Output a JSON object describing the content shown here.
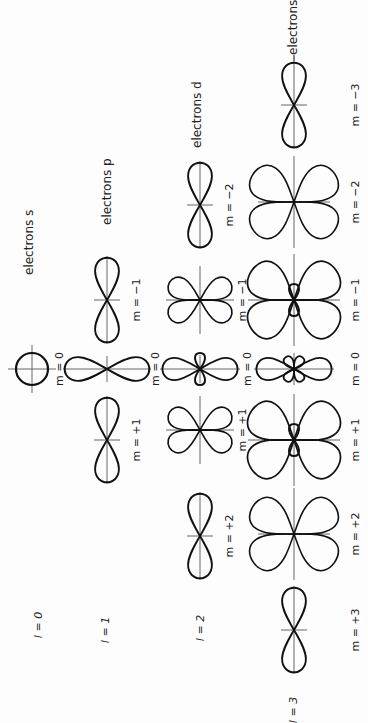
{
  "figure": {
    "rows": [
      {
        "l_label": "l = 0",
        "series_label": "electrons s",
        "orbitals": [
          {
            "m": "m = 0",
            "shape": "circle"
          }
        ]
      },
      {
        "l_label": "l = 1",
        "series_label": "electrons p",
        "orbitals": [
          {
            "m": "m = +1",
            "shape": "2-lobe-vertical"
          },
          {
            "m": "m = 0",
            "shape": "2-lobe-horizontal"
          },
          {
            "m": "m = −1",
            "shape": "2-lobe-vertical"
          }
        ]
      },
      {
        "l_label": "l = 2",
        "series_label": "electrons d",
        "orbitals": [
          {
            "m": "m = +2",
            "shape": "2-lobe-vertical"
          },
          {
            "m": "m = +1",
            "shape": "4-lobe-diagonal"
          },
          {
            "m": "m = 0",
            "shape": "2-lobe-horizontal-with-small-vertical"
          },
          {
            "m": "m = −1",
            "shape": "4-lobe-diagonal"
          },
          {
            "m": "m = −2",
            "shape": "2-lobe-vertical"
          }
        ]
      },
      {
        "l_label": "l = 3",
        "series_label": "electrons f",
        "orbitals": [
          {
            "m": "m = +3",
            "shape": "2-lobe-vertical"
          },
          {
            "m": "m = +2",
            "shape": "4-lobe-diagonal-large"
          },
          {
            "m": "m = +1",
            "shape": "4-lobe-large-with-small-vertical"
          },
          {
            "m": "m = 0",
            "shape": "2-lobe-horizontal-with-small-cross"
          },
          {
            "m": "m = −1",
            "shape": "4-lobe-large-with-small-vertical"
          },
          {
            "m": "m = −2",
            "shape": "4-lobe-diagonal-large"
          },
          {
            "m": "m = −3",
            "shape": "2-lobe-vertical"
          }
        ]
      }
    ],
    "labels": {
      "s": "electrons s",
      "p": "electrons p",
      "d": "electrons d",
      "f": "electrons f",
      "l0": "l = 0",
      "l1": "l = 1",
      "l2": "l = 2",
      "l3": "l = 3",
      "m_s0": "m = 0",
      "m_p1": "m = +1",
      "m_p0": "m = 0",
      "m_pm1": "m = −1",
      "m_d2": "m = +2",
      "m_d1": "m = +1",
      "m_d0": "m = 0",
      "m_dm1": "m = −1",
      "m_dm2": "m = −2",
      "m_f3": "m = +3",
      "m_f2": "m = +2",
      "m_f1": "m = +1",
      "m_f0": "m = 0",
      "m_fm1": "m = −1",
      "m_fm2": "m = −2",
      "m_fm3": "m = −3"
    }
  }
}
